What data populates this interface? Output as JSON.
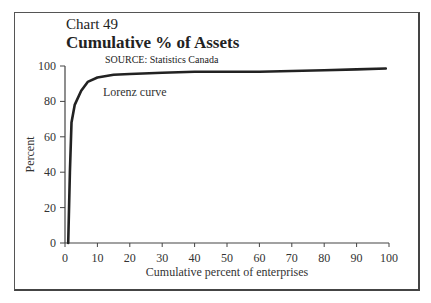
{
  "chart_data": {
    "type": "line",
    "chart_number": "Chart 49",
    "title": "Cumulative % of Assets",
    "subtitle": "SOURCE: Statistics Canada",
    "xlabel": "Cumulative percent of enterprises",
    "ylabel": "Percent",
    "xlim": [
      0,
      100
    ],
    "ylim": [
      0,
      100
    ],
    "xticks": [
      0,
      10,
      20,
      30,
      40,
      50,
      60,
      70,
      80,
      90,
      100
    ],
    "yticks": [
      0,
      20,
      40,
      60,
      80,
      100
    ],
    "grid": false,
    "series": [
      {
        "name": "Lorenz curve",
        "x": [
          1,
          1.5,
          2,
          3,
          5,
          7,
          10,
          15,
          20,
          30,
          40,
          50,
          60,
          70,
          80,
          90,
          99
        ],
        "y": [
          0,
          40,
          68,
          78,
          86,
          91,
          93.5,
          95,
          95.5,
          96.2,
          96.7,
          96.8,
          96.8,
          97.2,
          97.6,
          98.1,
          98.6
        ]
      }
    ],
    "annotations": [
      {
        "text": "Lorenz curve",
        "x": 12,
        "y": 86
      }
    ]
  }
}
